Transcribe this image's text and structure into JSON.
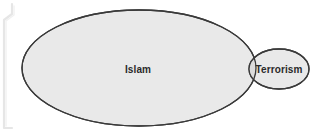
{
  "diagram": {
    "type": "venn",
    "background_color": "#ffffff",
    "stroke_color": "#3a3a3a",
    "fill_color": "#e9e9e9",
    "overlap_fill_color": "#dcdcdc",
    "label_color": "#2b2b2b",
    "edge_artifact_color": "#e4e4e4",
    "sets": [
      {
        "id": "islam",
        "label": "Islam",
        "shape": "ellipse",
        "cx": 139,
        "cy": 68,
        "rx": 117,
        "ry": 58,
        "fill": "#e9e9e9",
        "stroke": "#3a3a3a"
      },
      {
        "id": "terrorism",
        "label": "Terrorism",
        "shape": "ellipse",
        "cx": 279,
        "cy": 69,
        "rx": 30,
        "ry": 20,
        "fill": "#e9e9e9",
        "stroke": "#3a3a3a"
      }
    ],
    "overlap": {
      "id": "islam-terrorism-overlap",
      "label": "",
      "fill": "#dcdcdc"
    },
    "artifacts": [
      {
        "id": "left-edge-bracket",
        "description": "bracket-mark"
      }
    ]
  }
}
